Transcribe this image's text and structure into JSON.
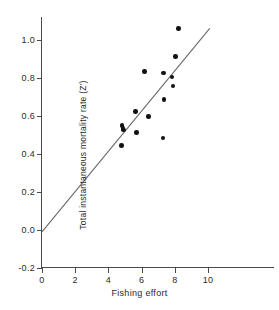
{
  "chart_data": {
    "type": "scatter",
    "title": "",
    "xlabel": "Fishing effort",
    "ylabel": "Total instantaneous mortality rate (Z')",
    "xlim": [
      0,
      11.8
    ],
    "ylim": [
      -0.2,
      1.12
    ],
    "xticks": [
      0,
      2,
      4,
      6,
      8,
      10
    ],
    "xticklabels": [
      "0",
      "2",
      "4",
      "6",
      "8",
      "10"
    ],
    "yticks": [
      -0.2,
      0.0,
      0.2,
      0.4,
      0.6,
      0.8,
      1.0
    ],
    "yticklabels": [
      "-0.2",
      "0.0",
      "0.2",
      "0.4",
      "0.6",
      "0.8",
      "1.0"
    ],
    "grid": false,
    "legend": null,
    "points": [
      {
        "x": 4.78,
        "y": 0.445
      },
      {
        "x": 4.82,
        "y": 0.548
      },
      {
        "x": 4.87,
        "y": 0.535
      },
      {
        "x": 4.92,
        "y": 0.525
      },
      {
        "x": 5.62,
        "y": 0.623
      },
      {
        "x": 5.68,
        "y": 0.513
      },
      {
        "x": 6.18,
        "y": 0.832
      },
      {
        "x": 6.42,
        "y": 0.596
      },
      {
        "x": 7.28,
        "y": 0.483
      },
      {
        "x": 7.3,
        "y": 0.826
      },
      {
        "x": 7.35,
        "y": 0.685
      },
      {
        "x": 7.82,
        "y": 0.805
      },
      {
        "x": 7.88,
        "y": 0.758
      },
      {
        "x": 8.02,
        "y": 0.912
      },
      {
        "x": 8.22,
        "y": 1.058
      }
    ],
    "fit_line": {
      "x0": 0.0,
      "y0": -0.01,
      "x1": 10.1,
      "y1": 1.06,
      "slope": 0.106,
      "intercept": -0.01
    }
  },
  "axis_ticks": {
    "y": [
      {
        "label": "1.0",
        "value": 1.0
      },
      {
        "label": "0.8",
        "value": 0.8
      },
      {
        "label": "0.6",
        "value": 0.6
      },
      {
        "label": "0.4",
        "value": 0.4
      },
      {
        "label": "0.2",
        "value": 0.2
      },
      {
        "label": "0.0",
        "value": 0.0
      },
      {
        "label": "-0.2",
        "value": -0.2
      }
    ],
    "x": [
      {
        "label": "0",
        "value": 0
      },
      {
        "label": "2",
        "value": 2
      },
      {
        "label": "4",
        "value": 4
      },
      {
        "label": "6",
        "value": 6
      },
      {
        "label": "8",
        "value": 8
      },
      {
        "label": "10",
        "value": 10
      }
    ]
  },
  "colors": {
    "marker": "#111111",
    "line": "#6a6a6a",
    "axis": "#4a4a4a",
    "text": "#2b2b2b",
    "background": "#ffffff"
  }
}
